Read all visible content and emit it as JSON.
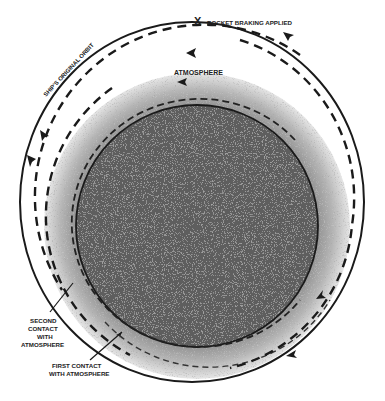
{
  "diagram": {
    "labels": {
      "braking_marker": "X",
      "braking": "ROCKET BRAKING APPLIED",
      "atmosphere": "ATMOSPHERE",
      "original_orbit": "SHIP'S ORIGINAL ORBIT",
      "second_contact_1": "SECOND",
      "second_contact_2": "CONTACT",
      "second_contact_3": "WITH",
      "second_contact_4": "ATMOSPHERE",
      "first_contact_1": "FIRST  CONTACT",
      "first_contact_2": "WITH ATMOSPHERE"
    },
    "colors": {
      "earth": "#5a5a5a",
      "atmosphere": "#bdbdbd",
      "line": "#1a1a1a",
      "background": "#ffffff"
    }
  }
}
